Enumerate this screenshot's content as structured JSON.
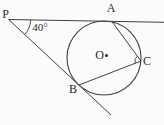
{
  "diagram": {
    "labels": {
      "point_p": "P",
      "point_a": "A",
      "point_b": "B",
      "point_c": "C",
      "center_o": "O",
      "angle_at_p": "40°"
    },
    "colors": {
      "line": "#3f3f3f",
      "text": "#2b2b2b",
      "background": "#fbfbfb"
    }
  }
}
